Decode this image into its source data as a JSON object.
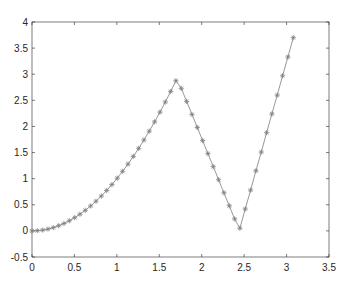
{
  "chart_data": {
    "type": "line",
    "title": "",
    "xlabel": "",
    "ylabel": "",
    "xlim": [
      0,
      3.5
    ],
    "ylim": [
      -0.5,
      4
    ],
    "grid": false,
    "legend": null,
    "x_ticks": [
      "0",
      "0.5",
      "1",
      "1.5",
      "2",
      "2.5",
      "3",
      "3.5"
    ],
    "y_ticks": [
      "-0.5",
      "0",
      "0.5",
      "1",
      "1.5",
      "2",
      "2.5",
      "3",
      "3.5",
      "4"
    ],
    "series": [
      {
        "name": "data",
        "marker": "*",
        "line_color": "#8c8c8c",
        "marker_color": "#7f7f7f",
        "x": [
          0.0,
          0.063,
          0.126,
          0.188,
          0.251,
          0.314,
          0.377,
          0.44,
          0.503,
          0.565,
          0.628,
          0.691,
          0.754,
          0.817,
          0.88,
          0.942,
          1.005,
          1.068,
          1.131,
          1.194,
          1.257,
          1.319,
          1.382,
          1.445,
          1.508,
          1.571,
          1.634,
          1.696,
          1.759,
          1.822,
          1.885,
          1.948,
          2.011,
          2.073,
          2.136,
          2.199,
          2.262,
          2.325,
          2.388,
          2.45,
          2.513,
          2.576,
          2.639,
          2.702,
          2.765,
          2.827,
          2.89,
          2.953,
          3.016,
          3.079
        ],
        "y": [
          0.0,
          0.004,
          0.016,
          0.035,
          0.063,
          0.099,
          0.142,
          0.194,
          0.253,
          0.319,
          0.394,
          0.477,
          0.568,
          0.667,
          0.774,
          0.887,
          1.01,
          1.141,
          1.279,
          1.426,
          1.58,
          1.74,
          1.91,
          2.088,
          2.274,
          2.468,
          2.67,
          2.876,
          2.73,
          2.48,
          2.23,
          1.98,
          1.73,
          1.48,
          1.23,
          0.98,
          0.73,
          0.48,
          0.23,
          0.05,
          0.42,
          0.78,
          1.15,
          1.51,
          1.88,
          2.24,
          2.6,
          2.97,
          3.33,
          3.7
        ]
      }
    ]
  }
}
